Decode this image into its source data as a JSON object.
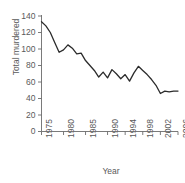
{
  "chart_data": {
    "type": "line",
    "title": "",
    "xlabel": "Year",
    "ylabel": "Total murdered",
    "xlim": [
      1975,
      2006
    ],
    "ylim": [
      0,
      140
    ],
    "grid": false,
    "legend": null,
    "xticks": [
      1975,
      1980,
      1985,
      1990,
      1994,
      1998,
      2002,
      2006
    ],
    "xtick_labels": [
      "1975",
      "1980",
      "1985",
      "1990",
      "1994",
      "1998",
      "2002",
      "2006"
    ],
    "yticks": [
      0,
      20,
      40,
      60,
      80,
      100,
      120,
      140
    ],
    "ytick_labels": [
      "0",
      "20",
      "40",
      "60",
      "80",
      "100",
      "120",
      "140"
    ],
    "x": [
      1975,
      1976,
      1977,
      1978,
      1979,
      1980,
      1981,
      1982,
      1983,
      1984,
      1985,
      1986,
      1987,
      1988,
      1989,
      1990,
      1991,
      1992,
      1993,
      1994,
      1995,
      1996,
      1997,
      1998,
      1999,
      2000,
      2001,
      2002,
      2003,
      2004,
      2005,
      2006
    ],
    "values": [
      133,
      128,
      120,
      108,
      96,
      99,
      105,
      101,
      94,
      95,
      86,
      80,
      74,
      66,
      72,
      65,
      75,
      70,
      64,
      69,
      61,
      71,
      79,
      74,
      69,
      63,
      56,
      46,
      49,
      48,
      49,
      49
    ],
    "series_color": "#2b2b2b",
    "axis_color": "#6b6b6b"
  }
}
